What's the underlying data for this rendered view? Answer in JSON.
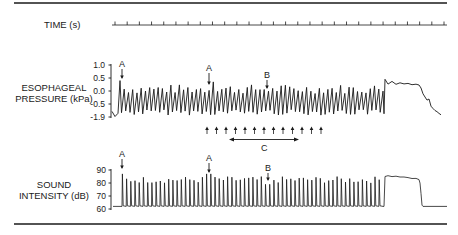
{
  "chart_data": [
    {
      "type": "line",
      "title": "TIME (s)",
      "description": "Time axis with regular tick marks",
      "tick_count": 28,
      "x_range_px": [
        112,
        447
      ]
    },
    {
      "type": "line",
      "ylabel": "ESOPHAGEAL PRESSURE (kPa)",
      "ylabel_lines": [
        "ESOPHAGEAL",
        "PRESSURE (kPa)"
      ],
      "yticks": [
        "1.0",
        "0.5",
        "0.0",
        "-0.5",
        "-1.9"
      ],
      "yticks_values": [
        1.0,
        0.5,
        0.0,
        -0.5,
        -1.9
      ],
      "grid": false,
      "series": [
        {
          "name": "Esophageal pressure",
          "description": "Rapid oscillations between about -1.5 and 0.2 kPa for the recording duration, then a plateau near 0.3 kPa followed by a decline to about -1.7 kPa",
          "oscillation_range": [
            -1.5,
            0.2
          ],
          "oscillation_count": 62,
          "plateau_value": 0.3,
          "end_value": -1.7
        }
      ],
      "annotations": [
        {
          "label": "A",
          "type": "arrow-down",
          "position": "start of oscillations (peak ~0.4 kPa)"
        },
        {
          "label": "A",
          "type": "arrow-down",
          "position": "mid-recording peak"
        },
        {
          "label": "B",
          "type": "arrow-down",
          "position": "later oscillation peak"
        },
        {
          "label": "",
          "type": "arrow-up-row",
          "count": 13,
          "position": "below trace"
        },
        {
          "label": "C",
          "type": "double-arrow",
          "position": "below arrow row"
        }
      ]
    },
    {
      "type": "line",
      "ylabel": "SOUND INTENSITY (dB)",
      "ylabel_lines": [
        "SOUND",
        "INTENSITY (dB)"
      ],
      "yticks": [
        "90",
        "80",
        "70",
        "60"
      ],
      "yticks_values": [
        90,
        80,
        70,
        60
      ],
      "ylim": [
        60,
        90
      ],
      "grid": false,
      "series": [
        {
          "name": "Sound intensity",
          "description": "Baseline ~62 dB with repeated spikes to ~83-86 dB, then a plateau ~85 dB dropping back to baseline",
          "baseline": 62,
          "spike_range": [
            80,
            87
          ],
          "spike_count": 62,
          "plateau_value": 85
        }
      ],
      "annotations": [
        {
          "label": "A",
          "type": "arrow-down",
          "position": "first spike (~87 dB)"
        },
        {
          "label": "A",
          "type": "arrow-down",
          "position": "mid-recording spike"
        },
        {
          "label": "B",
          "type": "arrow-down",
          "position": "later spike"
        }
      ]
    }
  ],
  "labels": {
    "time": "TIME (s)",
    "eso_line1": "ESOPHAGEAL",
    "eso_line2": "PRESSURE (kPa)",
    "sound_line1": "SOUND",
    "sound_line2": "INTENSITY (dB)",
    "eso_ticks": [
      "1.0",
      "0.5",
      "0.0",
      "-0.5",
      "-1.9"
    ],
    "sound_ticks": [
      "90",
      "80",
      "70",
      "60"
    ],
    "marker_a": "A",
    "marker_b": "B",
    "marker_c": "C"
  },
  "colors": {
    "ink": "#1a1a1a",
    "background": "#ffffff"
  }
}
